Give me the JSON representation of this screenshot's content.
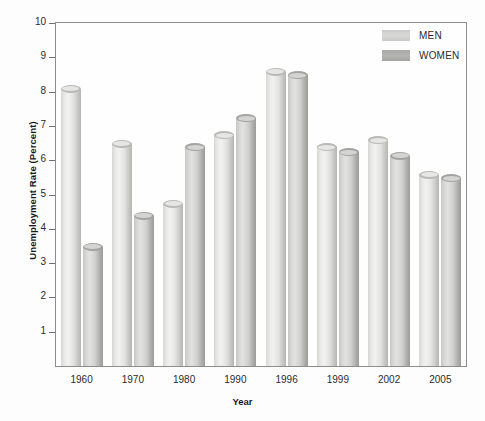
{
  "chart_data": {
    "type": "bar",
    "title": "",
    "xlabel": "Year",
    "ylabel": "Unemployment Rate (Percent)",
    "categories": [
      "1960",
      "1970",
      "1980",
      "1990",
      "1996",
      "1999",
      "2002",
      "2005"
    ],
    "series": [
      {
        "name": "MEN",
        "values": [
          8.2,
          6.6,
          4.85,
          6.85,
          8.7,
          6.5,
          6.7,
          5.7
        ]
      },
      {
        "name": "WOMEN",
        "values": [
          3.6,
          4.5,
          6.5,
          7.35,
          8.6,
          6.35,
          6.25,
          5.6
        ]
      }
    ],
    "ylim": [
      0,
      10
    ],
    "yticks": [
      1,
      2,
      3,
      4,
      5,
      6,
      7,
      8,
      9,
      10
    ],
    "ytick_labels": [
      "1",
      "2",
      "3",
      "4",
      "5",
      "6",
      "7",
      "8",
      "9",
      "10"
    ],
    "grid": false,
    "legend_position": "top-right",
    "colors": {
      "men": "#d8d8d6",
      "women": "#aaaaa8",
      "axis": "#8d8d8d",
      "text": "#231f20",
      "background": "#fdfdfd"
    }
  },
  "axes": {
    "y_title": "Unemployment Rate (Percent)",
    "x_title": "Year"
  },
  "legend": {
    "items": [
      {
        "label": "MEN"
      },
      {
        "label": "WOMEN"
      }
    ]
  }
}
